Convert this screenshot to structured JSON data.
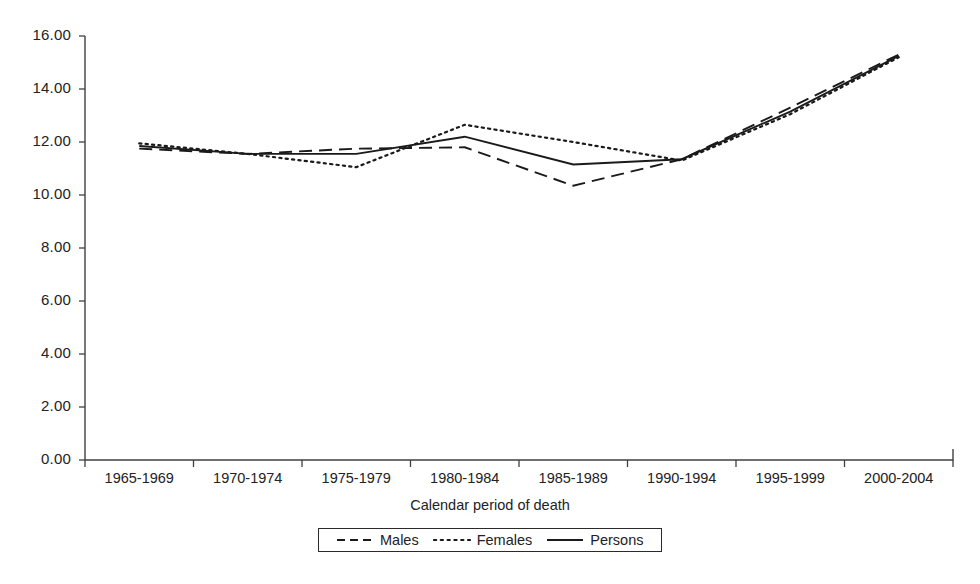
{
  "chart_data": {
    "type": "line",
    "title": "",
    "xlabel": "Calendar period of death",
    "ylabel": "",
    "categories": [
      "1965-1969",
      "1970-1974",
      "1975-1979",
      "1980-1984",
      "1985-1989",
      "1990-1994",
      "1995-1999",
      "2000-2004"
    ],
    "series": [
      {
        "name": "Males",
        "style": "dashed",
        "values": [
          11.75,
          11.55,
          11.75,
          11.8,
          10.35,
          11.35,
          13.3,
          15.3
        ]
      },
      {
        "name": "Females",
        "style": "dotted",
        "values": [
          11.95,
          11.55,
          11.05,
          12.65,
          12.0,
          11.3,
          13.05,
          15.2
        ]
      },
      {
        "name": "Persons",
        "style": "solid",
        "values": [
          11.85,
          11.55,
          11.55,
          12.2,
          11.15,
          11.35,
          13.15,
          15.25
        ]
      }
    ],
    "ylim": [
      0.0,
      16.0
    ],
    "ytick_step": 2.0,
    "ytick_labels": [
      "0.00",
      "2.00",
      "4.00",
      "6.00",
      "8.00",
      "10.00",
      "12.00",
      "14.00",
      "16.00"
    ],
    "grid": false,
    "legend_position": "bottom",
    "legend_entries": [
      "Males",
      "Females",
      "Persons"
    ],
    "line_color": "#1a1a1a"
  },
  "axis": {
    "x_title": "Calendar period of death"
  },
  "legend": {
    "items": [
      {
        "label": "Males"
      },
      {
        "label": "Females"
      },
      {
        "label": "Persons"
      }
    ]
  }
}
